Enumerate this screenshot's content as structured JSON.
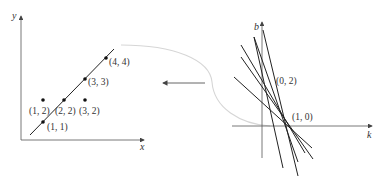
{
  "colors": {
    "ink": "#222222",
    "axis": "#555555",
    "curve": "#d8d8d8",
    "arrow": "#555555",
    "background": "#ffffff"
  },
  "left_plot": {
    "x_axis_label": "x",
    "y_axis_label": "y",
    "points": [
      {
        "label": "(1, 1)",
        "x": 1,
        "y": 1,
        "on_line": true
      },
      {
        "label": "(2, 2)",
        "x": 2,
        "y": 2,
        "on_line": true
      },
      {
        "label": "(3, 3)",
        "x": 3,
        "y": 3,
        "on_line": true
      },
      {
        "label": "(4, 4)",
        "x": 4,
        "y": 4,
        "on_line": true
      },
      {
        "label": "(1, 2)",
        "x": 1,
        "y": 2,
        "on_line": false
      },
      {
        "label": "(3, 2)",
        "x": 3,
        "y": 2,
        "on_line": false
      }
    ],
    "fit_line": "y = x"
  },
  "right_plot": {
    "x_axis_label": "k",
    "y_axis_label": "b",
    "labels": [
      {
        "label": "(0, 2)"
      },
      {
        "label": "(1, 0)"
      }
    ],
    "line_count": 6
  },
  "connector": {
    "description": "curved line from parameter-space intersection to fitted line, with left-pointing arrow"
  }
}
